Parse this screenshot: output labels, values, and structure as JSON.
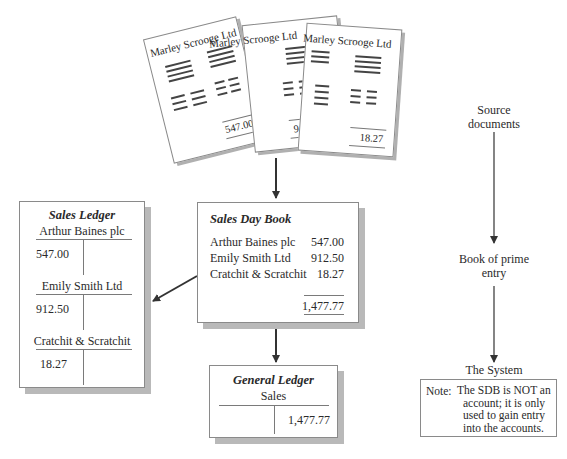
{
  "source_documents": {
    "papers": [
      {
        "company": "Marley Scrooge Ltd",
        "amount": "547.00"
      },
      {
        "company": "Marley Scrooge Ltd",
        "amount": "912.50"
      },
      {
        "company": "Marley Scrooge Ltd",
        "amount": "18.27"
      }
    ]
  },
  "sales_ledger": {
    "title": "Sales Ledger",
    "accounts": [
      {
        "name": "Arthur Baines plc",
        "debit": "547.00"
      },
      {
        "name": "Emily Smith Ltd",
        "debit": "912.50"
      },
      {
        "name": "Cratchit & Scratchit",
        "debit": "18.27"
      }
    ]
  },
  "sales_day_book": {
    "title": "Sales Day Book",
    "entries": [
      {
        "name": "Arthur Baines plc",
        "amount": "547.00"
      },
      {
        "name": "Emily Smith Ltd",
        "amount": "912.50"
      },
      {
        "name": "Cratchit & Scratchit",
        "amount": "18.27"
      }
    ],
    "total": "1,477.77"
  },
  "general_ledger": {
    "title": "General Ledger",
    "account": "Sales",
    "credit": "1,477.77"
  },
  "flow_labels": {
    "source_line1": "Source",
    "source_line2": "documents",
    "prime_line1": "Book of prime",
    "prime_line2": "entry",
    "system": "The System"
  },
  "note": {
    "label": "Note:",
    "lines": [
      "The SDB is NOT an",
      "account; it is only",
      "used to gain entry",
      "into the accounts."
    ]
  },
  "colors": {
    "line": "#7a7a7a",
    "shadow": "#b9b9b9",
    "arrow": "#333333"
  }
}
